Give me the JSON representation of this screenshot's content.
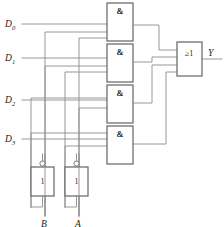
{
  "diagram": {
    "line_color": "#8c8c8c",
    "gate_border_color": "#6f6f6f",
    "text_color": "#1a1a1a"
  },
  "data_inputs": [
    {
      "id": "d0",
      "label": "D",
      "subscript": "0",
      "y": 24
    },
    {
      "id": "d1",
      "label": "D",
      "subscript": "1",
      "y": 58
    },
    {
      "id": "d2",
      "label": "D",
      "subscript": "2",
      "y": 100
    },
    {
      "id": "d3",
      "label": "D",
      "subscript": "3",
      "y": 139
    }
  ],
  "and_gates": [
    {
      "id": "and0",
      "symbol": "&"
    },
    {
      "id": "and1",
      "symbol": "&"
    },
    {
      "id": "and2",
      "symbol": "&"
    },
    {
      "id": "and3",
      "symbol": "&"
    }
  ],
  "or_gate": {
    "id": "or1",
    "symbol": "≥1"
  },
  "inverters": [
    {
      "id": "inv-b",
      "symbol": "1",
      "input_label": "B"
    },
    {
      "id": "inv-a",
      "symbol": "1",
      "input_label": "A"
    }
  ],
  "output": {
    "label": "Y"
  },
  "select_inputs": [
    {
      "id": "sel-b",
      "label": "B"
    },
    {
      "id": "sel-a",
      "label": "A"
    }
  ]
}
